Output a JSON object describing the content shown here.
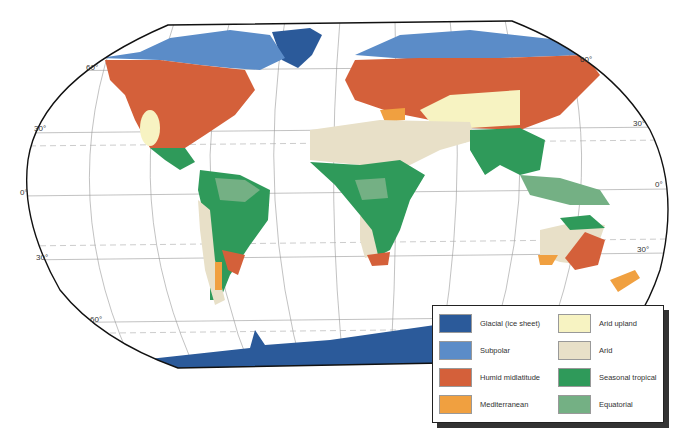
{
  "map": {
    "title": "World climate regions (Robinson projection)",
    "latitude_labels": [
      {
        "text": "60°",
        "x": 86,
        "y": 68
      },
      {
        "text": "30°",
        "x": 34,
        "y": 129
      },
      {
        "text": "0°",
        "x": 20,
        "y": 193
      },
      {
        "text": "30°",
        "x": 36,
        "y": 258
      },
      {
        "text": "60°",
        "x": 90,
        "y": 320
      },
      {
        "text": "60°",
        "x": 580,
        "y": 60
      },
      {
        "text": "30°",
        "x": 633,
        "y": 124
      },
      {
        "text": "0°",
        "x": 655,
        "y": 185
      },
      {
        "text": "30°",
        "x": 637,
        "y": 250
      }
    ]
  },
  "legend": {
    "items": [
      {
        "label": "Glacial (ice sheet)",
        "color": "#2b5a9a"
      },
      {
        "label": "Subpolar",
        "color": "#5b8cc8"
      },
      {
        "label": "Humid midlatitude",
        "color": "#d4603a"
      },
      {
        "label": "Mediterranean",
        "color": "#f0a040"
      },
      {
        "label": "Arid upland",
        "color": "#f7f3c2"
      },
      {
        "label": "Arid",
        "color": "#e8e0c8"
      },
      {
        "label": "Seasonal tropical",
        "color": "#2f9a5a"
      },
      {
        "label": "Equatorial",
        "color": "#74b084"
      }
    ]
  }
}
